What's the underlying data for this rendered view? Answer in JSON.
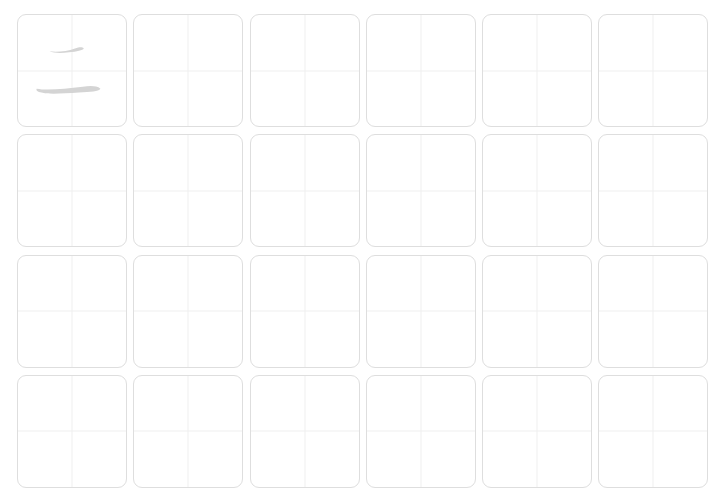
{
  "worksheet": {
    "rows": 4,
    "columns": 6,
    "practice_character": "二",
    "character_color": "#d4d4d4",
    "border_color": "#dedede",
    "guide_color": "#f0f0f0",
    "cells": [
      {
        "char": "二"
      },
      {
        "char": ""
      },
      {
        "char": ""
      },
      {
        "char": ""
      },
      {
        "char": ""
      },
      {
        "char": ""
      },
      {
        "char": ""
      },
      {
        "char": ""
      },
      {
        "char": ""
      },
      {
        "char": ""
      },
      {
        "char": ""
      },
      {
        "char": ""
      },
      {
        "char": ""
      },
      {
        "char": ""
      },
      {
        "char": ""
      },
      {
        "char": ""
      },
      {
        "char": ""
      },
      {
        "char": ""
      },
      {
        "char": ""
      },
      {
        "char": ""
      },
      {
        "char": ""
      },
      {
        "char": ""
      },
      {
        "char": ""
      },
      {
        "char": ""
      }
    ]
  }
}
